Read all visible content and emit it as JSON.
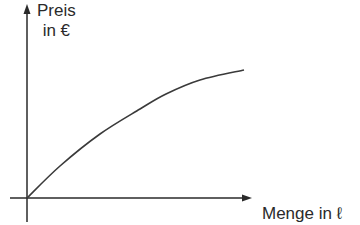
{
  "chart_data": {
    "type": "line",
    "title": "",
    "xlabel": "Menge in ℓ",
    "ylabel_line1": "Preis",
    "ylabel_line2": "in €",
    "grid": false,
    "legend": null,
    "ticks": false,
    "series": [
      {
        "name": "Preis",
        "shape": "concave increasing",
        "points_px": [
          [
            27,
            198
          ],
          [
            60,
            166
          ],
          [
            100,
            134
          ],
          [
            140,
            109
          ],
          [
            166,
            94
          ],
          [
            200,
            80
          ],
          [
            244,
            70
          ]
        ],
        "x": [
          0,
          0.15,
          0.33,
          0.52,
          0.64,
          0.79,
          1.0
        ],
        "y": [
          0,
          0.25,
          0.5,
          0.7,
          0.81,
          0.92,
          1.0
        ]
      }
    ],
    "colors": {
      "axis": "#2a2a2a",
      "curve": "#3a3a3a"
    }
  }
}
